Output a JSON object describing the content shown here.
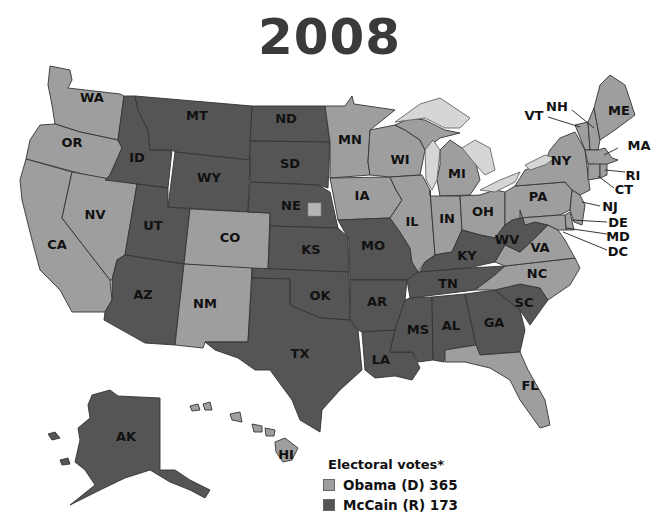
{
  "title": "2008",
  "colors": {
    "dem": "#9e9e9e",
    "rep": "#555555",
    "lake": "#d6d6d6",
    "background": "#ffffff"
  },
  "legend": {
    "title": "Electoral votes*",
    "items": [
      {
        "label": "Obama (D) 365",
        "party": "D",
        "candidate": "Obama",
        "votes": 365
      },
      {
        "label": "McCain (R) 173",
        "party": "R",
        "candidate": "McCain",
        "votes": 173
      }
    ]
  },
  "states": {
    "WA": "D",
    "OR": "D",
    "CA": "D",
    "NV": "D",
    "ID": "R",
    "MT": "R",
    "WY": "R",
    "UT": "R",
    "AZ": "R",
    "CO": "D",
    "NM": "D",
    "ND": "R",
    "SD": "R",
    "NE": "R",
    "KS": "R",
    "OK": "R",
    "TX": "R",
    "MN": "D",
    "IA": "D",
    "MO": "R",
    "AR": "R",
    "LA": "R",
    "WI": "D",
    "IL": "D",
    "MI": "D",
    "IN": "D",
    "OH": "D",
    "KY": "R",
    "TN": "R",
    "MS": "R",
    "AL": "R",
    "GA": "R",
    "FL": "D",
    "SC": "R",
    "NC": "D",
    "VA": "D",
    "WV": "R",
    "PA": "D",
    "NY": "D",
    "VT": "D",
    "NH": "D",
    "ME": "D",
    "MA": "D",
    "RI": "D",
    "CT": "D",
    "NJ": "D",
    "DE": "D",
    "MD": "D",
    "DC": "D",
    "AK": "R",
    "HI": "D"
  },
  "labels": {
    "WA": "WA",
    "OR": "OR",
    "CA": "CA",
    "NV": "NV",
    "ID": "ID",
    "MT": "MT",
    "WY": "WY",
    "UT": "UT",
    "AZ": "AZ",
    "CO": "CO",
    "NM": "NM",
    "ND": "ND",
    "SD": "SD",
    "NE": "NE",
    "KS": "KS",
    "OK": "OK",
    "TX": "TX",
    "MN": "MN",
    "IA": "IA",
    "MO": "MO",
    "AR": "AR",
    "LA": "LA",
    "WI": "WI",
    "IL": "IL",
    "MI": "MI",
    "IN": "IN",
    "OH": "OH",
    "KY": "KY",
    "TN": "TN",
    "MS": "MS",
    "AL": "AL",
    "GA": "GA",
    "FL": "FL",
    "SC": "SC",
    "NC": "NC",
    "VA": "VA",
    "WV": "WV",
    "PA": "PA",
    "NY": "NY",
    "VT": "VT",
    "NH": "NH",
    "ME": "ME",
    "MA": "MA",
    "RI": "RI",
    "CT": "CT",
    "NJ": "NJ",
    "DE": "DE",
    "MD": "MD",
    "DC": "DC",
    "AK": "AK",
    "HI": "HI"
  },
  "annotations": {
    "NE_split": "Nebraska 2nd district square (Obama)"
  }
}
